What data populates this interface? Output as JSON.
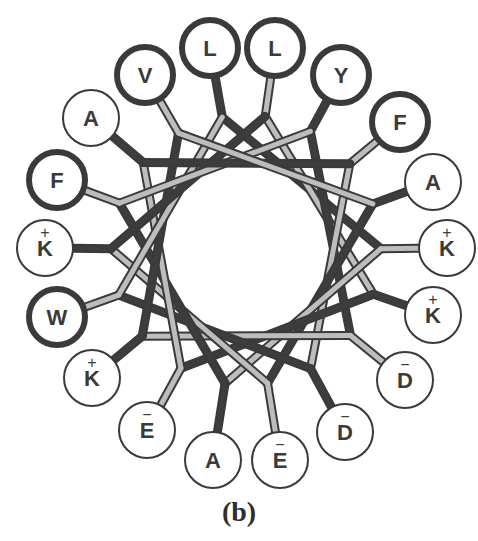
{
  "figure": {
    "caption": "(b)",
    "type": "helical wheel projection",
    "center": [
      246,
      250
    ],
    "inner_radius": 97,
    "residue_radius": 28,
    "colors": {
      "hydrophobic_outline": "#3a3a3a",
      "polar_outline": "#3a3a3a",
      "dark_bond": "#3d3d3d",
      "light_bond": "#bdbdbd",
      "label": "#3a3a3a",
      "background": "#ffffff"
    },
    "residues": [
      {
        "label": "L",
        "charge": "",
        "hydrophobic": true,
        "x": 210,
        "y": 48
      },
      {
        "label": "L",
        "charge": "",
        "hydrophobic": true,
        "x": 275,
        "y": 48
      },
      {
        "label": "Y",
        "charge": "",
        "hydrophobic": true,
        "x": 341,
        "y": 75
      },
      {
        "label": "F",
        "charge": "",
        "hydrophobic": true,
        "x": 400,
        "y": 122
      },
      {
        "label": "A",
        "charge": "",
        "hydrophobic": false,
        "x": 433,
        "y": 182
      },
      {
        "label": "K",
        "charge": "+",
        "hydrophobic": false,
        "x": 447,
        "y": 248
      },
      {
        "label": "K",
        "charge": "+",
        "hydrophobic": false,
        "x": 433,
        "y": 315
      },
      {
        "label": "D",
        "charge": "−",
        "hydrophobic": false,
        "x": 405,
        "y": 380
      },
      {
        "label": "D",
        "charge": "−",
        "hydrophobic": false,
        "x": 345,
        "y": 432
      },
      {
        "label": "E",
        "charge": "−",
        "hydrophobic": false,
        "x": 280,
        "y": 460
      },
      {
        "label": "A",
        "charge": "",
        "hydrophobic": false,
        "x": 213,
        "y": 460
      },
      {
        "label": "E",
        "charge": "−",
        "hydrophobic": false,
        "x": 147,
        "y": 430
      },
      {
        "label": "K",
        "charge": "+",
        "hydrophobic": false,
        "x": 92,
        "y": 378
      },
      {
        "label": "W",
        "charge": "",
        "hydrophobic": true,
        "x": 57,
        "y": 317
      },
      {
        "label": "K",
        "charge": "+",
        "hydrophobic": false,
        "x": 45,
        "y": 248
      },
      {
        "label": "F",
        "charge": "",
        "hydrophobic": true,
        "x": 57,
        "y": 180
      },
      {
        "label": "A",
        "charge": "",
        "hydrophobic": false,
        "x": 91,
        "y": 118
      },
      {
        "label": "V",
        "charge": "",
        "hydrophobic": true,
        "x": 145,
        "y": 75
      }
    ]
  }
}
